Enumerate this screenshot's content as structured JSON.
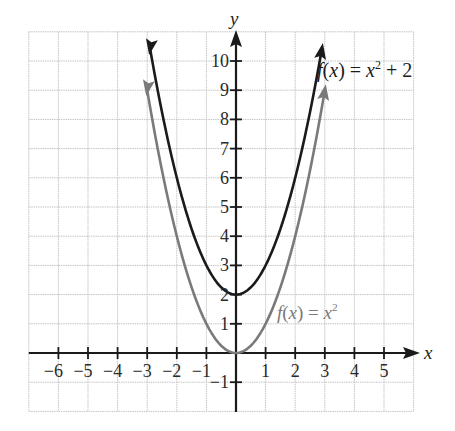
{
  "chart_data": {
    "type": "line",
    "title": "",
    "xlabel": "x",
    "ylabel": "y",
    "xlim": [
      -7,
      6
    ],
    "ylim": [
      -2,
      11
    ],
    "grid": true,
    "x_ticks": [
      -6,
      -5,
      -4,
      -3,
      -2,
      -1,
      1,
      2,
      3,
      4,
      5
    ],
    "x_tick_labels": [
      "−6",
      "−5",
      "−4",
      "−3",
      "−2",
      "−1",
      "1",
      "2",
      "3",
      "4",
      "5"
    ],
    "y_ticks": [
      -1,
      1,
      2,
      3,
      4,
      5,
      6,
      7,
      8,
      9,
      10
    ],
    "y_tick_labels": [
      "−1",
      "1",
      "2",
      "3",
      "4",
      "5",
      "6",
      "7",
      "8",
      "9",
      "10"
    ],
    "series": [
      {
        "name": "f(x) = x² + 2",
        "equation": "x^2 + 2",
        "color": "#1a1a1a",
        "x_range": [
          -2.9,
          2.9
        ],
        "points": [
          [
            -2.9,
            10.41
          ],
          [
            -2,
            6
          ],
          [
            -1,
            3
          ],
          [
            0,
            2
          ],
          [
            1,
            3
          ],
          [
            2,
            6
          ],
          [
            2.9,
            10.41
          ]
        ],
        "arrows": "both"
      },
      {
        "name": "f(x) = x²",
        "equation": "x^2",
        "color": "#7a7a7a",
        "x_range": [
          -3.0,
          3.0
        ],
        "points": [
          [
            -3,
            9
          ],
          [
            -2,
            4
          ],
          [
            -1,
            1
          ],
          [
            0,
            0
          ],
          [
            1,
            1
          ],
          [
            2,
            4
          ],
          [
            3,
            9
          ]
        ],
        "arrows": "both"
      }
    ],
    "annotations": [
      {
        "text_fx": "f(x) = ",
        "text_var": "x",
        "sup": "2",
        "tail": " + 2",
        "x": 2.9,
        "y": 10.2,
        "color": "#1a1a1a"
      },
      {
        "text_fx": "f(x) = ",
        "text_var": "x",
        "sup": "2",
        "tail": "",
        "x": 1.4,
        "y": 1.0,
        "color": "#7a7a7a"
      }
    ],
    "legend": null
  },
  "labels": {
    "x_axis": "x",
    "y_axis": "y",
    "curve1_label": "f(x) = x² + 2",
    "curve2_label": "f(x) = x²"
  }
}
